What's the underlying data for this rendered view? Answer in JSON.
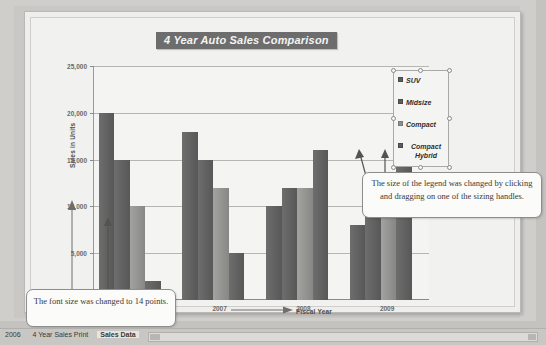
{
  "chart_data": {
    "type": "bar",
    "title": "4 Year Auto Sales Comparison",
    "xlabel": "Fiscal Year",
    "ylabel": "Sales in Units",
    "categories": [
      "2006",
      "2007",
      "2008",
      "2009"
    ],
    "series": [
      {
        "name": "SUV",
        "values": [
          20000,
          18000,
          10000,
          8000
        ],
        "color": "#5d5d5d"
      },
      {
        "name": "Midsize",
        "values": [
          15000,
          15000,
          12000,
          12000
        ],
        "color": "#5d5d5d"
      },
      {
        "name": "Compact",
        "values": [
          10000,
          12000,
          12000,
          12000
        ],
        "color": "#8e8e8c"
      },
      {
        "name": "Compact Hybrid",
        "values": [
          2000,
          5000,
          16000,
          22000
        ],
        "color": "#5d5d5d"
      }
    ],
    "ylim": [
      0,
      25000
    ],
    "y_ticks": [
      "0",
      "5,000",
      "10,000",
      "15,000",
      "20,000",
      "25,000"
    ],
    "y_tick_values": [
      0,
      5000,
      10000,
      15000,
      20000,
      25000
    ],
    "grid": true,
    "legend_position": "right"
  },
  "legend": {
    "entries": [
      {
        "label": "SUV"
      },
      {
        "label": "Midsize"
      },
      {
        "label": "Compact"
      },
      {
        "label": "Compact Hybrid"
      }
    ],
    "selected": true
  },
  "callouts": [
    {
      "id": "legend-callout",
      "text": "The size of the legend was changed by clicking and dragging on one of the sizing handles."
    },
    {
      "id": "font-callout",
      "text": "The font size was changed to 14 points."
    }
  ],
  "status_bar": {
    "sheet_tabs": [
      "2006",
      "4 Year Sales Print",
      "Sales Data"
    ],
    "active_tab": "Sales Data"
  },
  "colors": {
    "title_background": "#6d6d6d",
    "title_text": "#f4f4f2",
    "bar_dark": "#5d5d5d",
    "bar_light": "#8e8e8c",
    "plot_background": "#f4f4f2",
    "chart_background": "#f1f1ef"
  }
}
